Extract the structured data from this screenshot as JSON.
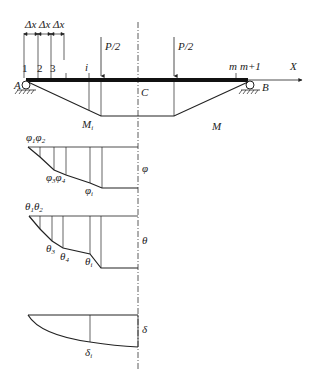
{
  "diagram": {
    "beam": {
      "support_left": "A",
      "support_right": "B",
      "axis_label": "X",
      "center_label": "C",
      "load_left": "P/2",
      "load_right": "P/2",
      "segment_label": "Δx",
      "node_labels": [
        "1",
        "2",
        "3",
        "i",
        "m",
        "m+1"
      ]
    },
    "moment_diagram": {
      "label": "M",
      "point_label": "M",
      "point_sub": "i"
    },
    "phi_diagram": {
      "label": "φ",
      "top_labels": [
        "φ",
        "φ"
      ],
      "top_subs": [
        "1",
        "2"
      ],
      "mid_labels": [
        "φ",
        "φ"
      ],
      "mid_subs": [
        "3",
        "4"
      ],
      "point_label": "φ",
      "point_sub": "i"
    },
    "theta_diagram": {
      "label": "θ",
      "top_labels": [
        "θ",
        "θ"
      ],
      "top_subs": [
        "1",
        "2"
      ],
      "mid_labels": [
        "θ",
        "θ"
      ],
      "mid_subs": [
        "3",
        "4"
      ],
      "point_label": "θ",
      "point_sub": "i"
    },
    "delta_diagram": {
      "label": "δ",
      "point_label": "δ",
      "point_sub": "i"
    }
  }
}
